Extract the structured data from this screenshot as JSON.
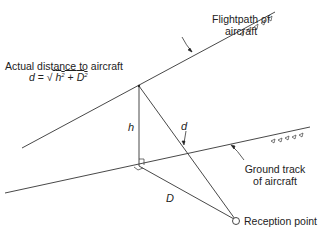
{
  "labels": {
    "flightpath_line1": "Flightpath of",
    "flightpath_line2": "aircraft",
    "actual_distance": "Actual distance to aircraft",
    "formula_lhs": "d",
    "formula_eq": " = ",
    "formula_sqrt": "√",
    "formula_h": "h",
    "formula_exp1": "2",
    "formula_plus": " + ",
    "formula_D": "D",
    "formula_exp2": "2",
    "h": "h",
    "d": "d",
    "D": "D",
    "ground_track_line1": "Ground track",
    "ground_track_line2": "of aircraft",
    "reception_point": "Reception point"
  },
  "colors": {
    "line": "#333333",
    "text": "#222222",
    "background": "#ffffff"
  }
}
